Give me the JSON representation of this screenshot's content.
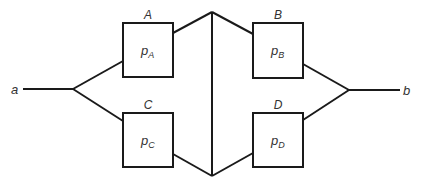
{
  "diagram": {
    "type": "reliability-network",
    "terminals": {
      "start": "a",
      "end": "b"
    },
    "components": [
      {
        "id": "A",
        "label": "A",
        "prob_base": "p",
        "prob_sub": "A"
      },
      {
        "id": "B",
        "label": "B",
        "prob_base": "p",
        "prob_sub": "B"
      },
      {
        "id": "C",
        "label": "C",
        "prob_base": "p",
        "prob_sub": "C"
      },
      {
        "id": "D",
        "label": "D",
        "prob_base": "p",
        "prob_sub": "D"
      }
    ],
    "edges": [
      [
        "a",
        "A"
      ],
      [
        "a",
        "C"
      ],
      [
        "A",
        "bridge-top"
      ],
      [
        "C",
        "bridge-bottom"
      ],
      [
        "bridge-top",
        "bridge-bottom"
      ],
      [
        "bridge-top",
        "B"
      ],
      [
        "bridge-bottom",
        "D"
      ],
      [
        "B",
        "b"
      ],
      [
        "D",
        "b"
      ]
    ],
    "colors": {
      "line": "#1a1a1a",
      "text": "#333333",
      "background": "#ffffff"
    }
  }
}
